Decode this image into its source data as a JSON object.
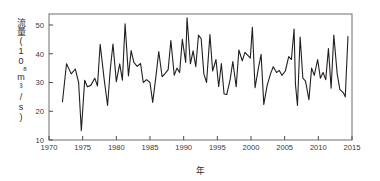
{
  "chart_data": {
    "type": "line",
    "title": "",
    "xlabel": "年",
    "ylabel": "流量(10⁸m³/s)",
    "ylabel_parts": {
      "name": "流量",
      "open_paren": "(",
      "base": "10",
      "exponent": "8",
      "unit": "m³/s",
      "close_paren": ")"
    },
    "xlim": [
      1970,
      2015
    ],
    "ylim": [
      10,
      55
    ],
    "xticks": [
      1970,
      1975,
      1980,
      1985,
      1990,
      1995,
      2000,
      2005,
      2010,
      2015
    ],
    "yticks": [
      10,
      20,
      30,
      40,
      50
    ],
    "grid": false,
    "legend": null,
    "line_color": "#231f1e",
    "axis_color": "#6f6f6f",
    "series": [
      {
        "name": "年流量",
        "x": [
          1972,
          1973,
          1974,
          1975,
          1976,
          1977,
          1978,
          1979,
          1980,
          1981,
          1982,
          1983,
          1984,
          1985,
          1986,
          1987,
          1988,
          1989,
          1990,
          1991,
          1992,
          1993,
          1994,
          1995,
          1996,
          1997,
          1998,
          1999,
          2000,
          2001,
          2002,
          2003,
          2004,
          2005,
          2006,
          2007,
          2008,
          2009,
          2010,
          2011,
          2012,
          2013,
          2014
        ],
        "values": [
          23.3,
          36.5,
          33.2,
          34.7,
          27.0,
          13.2,
          30.8,
          31.5,
          28.5,
          29.2,
          43.3,
          22.0,
          34.5,
          43.4,
          27.5,
          36.5,
          30.8,
          50.4,
          32.3,
          41.1,
          37.0,
          35.6,
          36.6,
          30.0,
          31.0,
          23.1,
          40.8,
          32.5,
          35.5,
          44.7,
          38.0,
          46.4,
          33.5,
          42.9,
          52.5,
          35.7,
          41.3,
          46.6,
          46.0,
          31.5,
          44.5,
          29.0,
          44.8
        ],
        "note": "annual-mean-discharge"
      }
    ],
    "raw_points": [
      [
        1972.0,
        23.3
      ],
      [
        1972.6,
        36.5
      ],
      [
        1973.3,
        33.0
      ],
      [
        1973.9,
        34.7
      ],
      [
        1974.4,
        30.0
      ],
      [
        1974.8,
        13.2
      ],
      [
        1975.3,
        30.8
      ],
      [
        1975.7,
        28.5
      ],
      [
        1976.2,
        29.0
      ],
      [
        1976.8,
        31.5
      ],
      [
        1977.2,
        28.8
      ],
      [
        1977.6,
        43.3
      ],
      [
        1978.2,
        31.0
      ],
      [
        1978.7,
        22.0
      ],
      [
        1979.1,
        34.5
      ],
      [
        1979.5,
        43.4
      ],
      [
        1980.0,
        30.3
      ],
      [
        1980.5,
        36.5
      ],
      [
        1980.9,
        30.8
      ],
      [
        1981.3,
        50.4
      ],
      [
        1981.8,
        32.3
      ],
      [
        1982.2,
        41.1
      ],
      [
        1982.6,
        37.0
      ],
      [
        1983.1,
        35.6
      ],
      [
        1983.6,
        36.6
      ],
      [
        1984.0,
        30.0
      ],
      [
        1984.5,
        31.0
      ],
      [
        1985.0,
        30.0
      ],
      [
        1985.4,
        23.1
      ],
      [
        1985.9,
        32.5
      ],
      [
        1986.3,
        40.8
      ],
      [
        1986.8,
        32.0
      ],
      [
        1987.2,
        33.0
      ],
      [
        1987.7,
        34.5
      ],
      [
        1988.1,
        44.6
      ],
      [
        1988.6,
        32.5
      ],
      [
        1989.0,
        35.0
      ],
      [
        1989.4,
        33.5
      ],
      [
        1989.8,
        45.0
      ],
      [
        1990.3,
        37.0
      ],
      [
        1990.5,
        52.5
      ],
      [
        1991.0,
        36.5
      ],
      [
        1991.4,
        41.0
      ],
      [
        1991.8,
        35.5
      ],
      [
        1992.2,
        46.5
      ],
      [
        1992.6,
        45.2
      ],
      [
        1993.0,
        33.0
      ],
      [
        1993.4,
        30.0
      ],
      [
        1993.9,
        46.7
      ],
      [
        1994.3,
        34.0
      ],
      [
        1994.8,
        38.0
      ],
      [
        1995.2,
        28.5
      ],
      [
        1995.6,
        36.6
      ],
      [
        1996.0,
        26.0
      ],
      [
        1996.4,
        25.8
      ],
      [
        1996.9,
        31.0
      ],
      [
        1997.3,
        37.3
      ],
      [
        1997.8,
        28.5
      ],
      [
        1998.2,
        41.3
      ],
      [
        1998.7,
        37.5
      ],
      [
        1999.1,
        40.5
      ],
      [
        1999.5,
        39.5
      ],
      [
        1999.9,
        38.5
      ],
      [
        2000.2,
        49.2
      ],
      [
        2000.6,
        28.2
      ],
      [
        2001.1,
        35.0
      ],
      [
        2001.5,
        39.8
      ],
      [
        2001.9,
        22.4
      ],
      [
        2002.4,
        29.0
      ],
      [
        2002.9,
        33.0
      ],
      [
        2003.3,
        35.5
      ],
      [
        2003.8,
        33.5
      ],
      [
        2004.2,
        34.2
      ],
      [
        2004.6,
        32.5
      ],
      [
        2005.1,
        34.0
      ],
      [
        2005.6,
        39.0
      ],
      [
        2006.0,
        38.0
      ],
      [
        2006.4,
        48.6
      ],
      [
        2006.6,
        29.5
      ],
      [
        2006.9,
        22.0
      ],
      [
        2007.3,
        45.8
      ],
      [
        2007.7,
        31.5
      ],
      [
        2008.1,
        30.5
      ],
      [
        2008.6,
        24.0
      ],
      [
        2009.0,
        35.0
      ],
      [
        2009.4,
        32.5
      ],
      [
        2009.9,
        38.0
      ],
      [
        2010.3,
        31.5
      ],
      [
        2010.7,
        33.5
      ],
      [
        2011.1,
        31.0
      ],
      [
        2011.5,
        41.8
      ],
      [
        2011.9,
        28.0
      ],
      [
        2012.3,
        46.5
      ],
      [
        2012.8,
        33.0
      ],
      [
        2013.2,
        27.5
      ],
      [
        2013.7,
        26.5
      ],
      [
        2014.0,
        25.0
      ],
      [
        2014.4,
        46.0
      ]
    ]
  }
}
